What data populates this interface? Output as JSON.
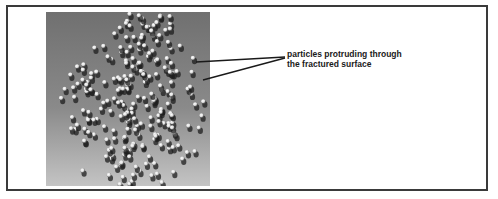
{
  "figure": {
    "annotation": {
      "line1": "particles protruding through",
      "line2": "the fractured surface"
    },
    "image": {
      "description": "electron micrograph of fractured surface with protruding particles",
      "colors": {
        "background_top": "#6e6e6e",
        "background_bottom": "#bdbdbd",
        "particle": "#f2f2f2",
        "shadow": "#1e1e1e"
      }
    },
    "frame_color": "#3a3a3a"
  }
}
